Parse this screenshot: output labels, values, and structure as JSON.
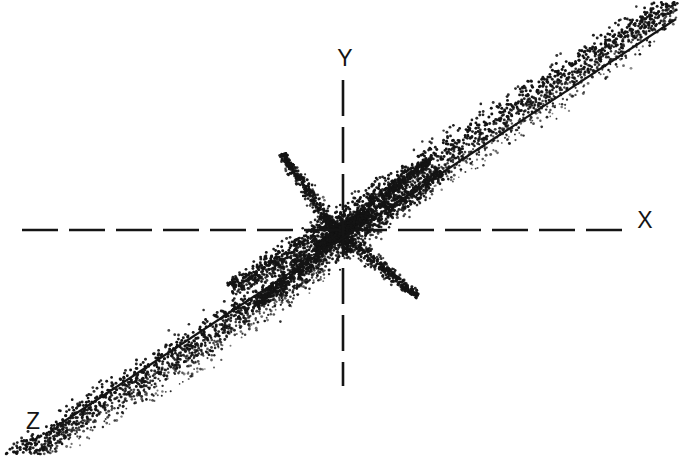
{
  "figure": {
    "title": "",
    "background_color": "#ffffff",
    "ink_color": "#141414",
    "width": 680,
    "height": 456
  },
  "axes": {
    "x_label": "X",
    "y_label": "Y",
    "z_label": "Z",
    "x_label_pos": [
      645,
      228
    ],
    "y_label_pos": [
      345,
      66
    ],
    "z_label_pos": [
      33,
      429
    ],
    "origin": [
      343,
      230
    ],
    "x_axis": {
      "style": "dashed",
      "from": [
        22,
        230
      ],
      "to": [
        622,
        230
      ],
      "dash": "36 11"
    },
    "y_axis": {
      "style": "dashed",
      "from": [
        343,
        80
      ],
      "to": [
        343,
        386
      ],
      "dash": "36 11"
    },
    "z_axis": {
      "style": "solid",
      "from": [
        57,
        426
      ],
      "to": [
        676,
        19
      ]
    }
  },
  "chart_data": {
    "type": "scatter",
    "title": "",
    "xlabel": "X",
    "ylabel": "Y",
    "zlabel": "Z",
    "grid": false,
    "legend": "none",
    "xlim": [
      22,
      676
    ],
    "ylim": [
      19,
      426
    ],
    "clusters": [
      {
        "name": "upper-right-major-lobe",
        "axis_angle_deg": -33.3,
        "center": [
          505,
          106
        ],
        "length": 330,
        "half_width": 30,
        "density": 2600,
        "tip": [
          645,
          35
        ],
        "bias": "dense below axis line"
      },
      {
        "name": "lower-left-major-lobe",
        "axis_angle_deg": -33.3,
        "center": [
          182,
          342
        ],
        "length": 310,
        "half_width": 28,
        "density": 2400,
        "tip": [
          70,
          416
        ],
        "bias": "dense below axis line"
      },
      {
        "name": "center-lobe-upper-left",
        "axis_angle_deg": -125,
        "center": [
          316,
          203
        ],
        "length": 60,
        "half_width": 11,
        "density": 420,
        "tip": [
          294,
          188
        ]
      },
      {
        "name": "center-lobe-upper-right",
        "axis_angle_deg": -38,
        "center": [
          372,
          205
        ],
        "length": 72,
        "half_width": 13,
        "density": 520,
        "tip": [
          400,
          180
        ]
      },
      {
        "name": "center-lobe-lower-left",
        "axis_angle_deg": 140,
        "center": [
          312,
          258
        ],
        "length": 74,
        "half_width": 13,
        "density": 520,
        "tip": [
          284,
          282
        ]
      },
      {
        "name": "center-lobe-lower-right",
        "axis_angle_deg": 40,
        "center": [
          370,
          257
        ],
        "length": 62,
        "half_width": 11,
        "density": 430,
        "tip": [
          394,
          276
        ]
      },
      {
        "name": "core",
        "axis_angle_deg": -33.3,
        "center": [
          343,
          230
        ],
        "length": 30,
        "half_width": 9,
        "density": 700
      }
    ]
  }
}
